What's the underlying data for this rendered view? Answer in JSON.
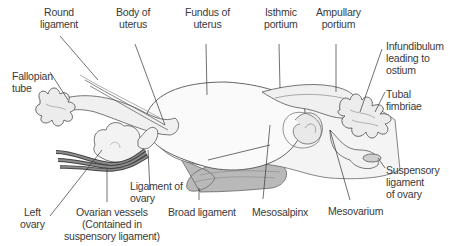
{
  "diagram": {
    "colors": {
      "outline": "#555555",
      "fill_light": "#f2f2f2",
      "fill_white": "#fafafa",
      "fill_ligament": "#b9b9b9",
      "vessel_dark": "#5a5a5a",
      "leader_line": "#333333",
      "label_text": "#3a3a3a"
    },
    "labels": {
      "round_ligament": "Round\nligament",
      "body_of_uterus": "Body of\nuterus",
      "fundus_of_uterus": "Fundus of\nuterus",
      "isthmic_portium": "Isthmic\nportium",
      "ampullary_portium": "Ampullary\nportium",
      "infundibulum": "Infundibulum\nleading to\nostium",
      "fallopian_tube": "Fallopian\ntube",
      "tubal_fimbriae": "Tubal\nfimbriae",
      "ligament_of_ovary": "Ligament of\novary",
      "suspensory_ligament": "Suspensory\nligament\nof ovary",
      "left_ovary": "Left\novary",
      "ovarian_vessels": "Ovarian vessels\n(Contained in\nsuspensory ligament)",
      "broad_ligament": "Broad ligament",
      "mesosalpinx": "Mesosalpinx",
      "mesovarium": "Mesovarium"
    }
  }
}
